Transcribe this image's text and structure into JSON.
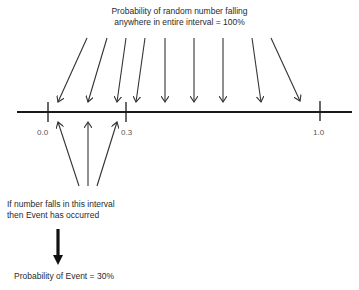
{
  "diagram": {
    "title_line1": "Probability of random number falling",
    "title_line2": "anywhere in entire interval = 100%",
    "number_line": {
      "ticks": [
        {
          "label": "0.0",
          "value": 0.0
        },
        {
          "label": "0.3",
          "value": 0.3
        },
        {
          "label": "1.0",
          "value": 1.0
        }
      ]
    },
    "event_note_line1": "If number falls in this interval",
    "event_note_line2": "then Event has occurred",
    "result": "Probability of Event = 30%",
    "colors": {
      "line": "#1a1a1a",
      "arrow": "#333333",
      "text": "#2a2a2a"
    }
  }
}
